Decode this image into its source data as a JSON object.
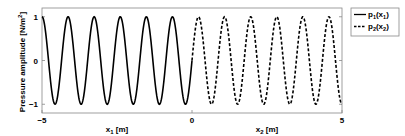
{
  "chart_data": {
    "type": "line",
    "title": "",
    "ylabel": "Pressure amplitude [N/m^2]",
    "ylabel_parts": {
      "main": "Pressure amplitude [N/m",
      "sup": "2",
      "end": "]"
    },
    "xlabels": [
      {
        "text": "x",
        "sub": "1",
        "rest": " [m]",
        "center": -2.5
      },
      {
        "text": "x",
        "sub": "2",
        "rest": " [m]",
        "center": 2.5
      }
    ],
    "xlim": [
      -5,
      5
    ],
    "ylim": [
      -1.2,
      1.2
    ],
    "xticks": [
      -5,
      0,
      5
    ],
    "yticks": [
      -1,
      0,
      1
    ],
    "grid": false,
    "legend": {
      "position": "outside-right-top",
      "entries": [
        {
          "label": "p",
          "sub": "1",
          "arg": "x",
          "argsub": "1",
          "style": "solid"
        },
        {
          "label": "p",
          "sub": "2",
          "arg": "x",
          "argsub": "2",
          "style": "dashed"
        }
      ]
    },
    "series": [
      {
        "name": "p1(x1)",
        "style": "solid",
        "color": "#000000",
        "x_range": [
          -5,
          0
        ],
        "function": "cos",
        "amplitude": 1,
        "cycles": 5.75,
        "phase_start": "peak"
      },
      {
        "name": "p2(x2)",
        "style": "dashed",
        "color": "#000000",
        "x_range": [
          0,
          5
        ],
        "function": "continuation",
        "amplitude": 1,
        "cycles": 5.75
      }
    ]
  }
}
